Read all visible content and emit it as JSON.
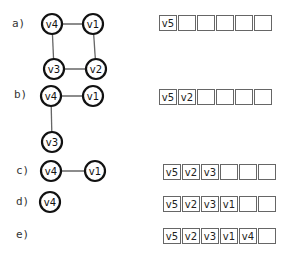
{
  "steps": [
    {
      "label": "a)",
      "queue": [
        "v5",
        "",
        "",
        "",
        "",
        ""
      ],
      "nodes": [
        {
          "id": "v4",
          "x": 52,
          "y": 24
        },
        {
          "id": "v1",
          "x": 93,
          "y": 24
        },
        {
          "id": "v3",
          "x": 54,
          "y": 69
        },
        {
          "id": "v2",
          "x": 96,
          "y": 69
        }
      ],
      "edges": [
        [
          "v4",
          "v1"
        ],
        [
          "v1",
          "v2"
        ],
        [
          "v2",
          "v3"
        ],
        [
          "v3",
          "v4"
        ]
      ]
    },
    {
      "label": "b)",
      "queue": [
        "v5",
        "v2",
        "",
        "",
        "",
        ""
      ],
      "nodes": [
        {
          "id": "v4",
          "x": 51,
          "y": 96
        },
        {
          "id": "v1",
          "x": 93,
          "y": 96
        },
        {
          "id": "v3",
          "x": 52,
          "y": 142
        }
      ],
      "edges": [
        [
          "v4",
          "v1"
        ],
        [
          "v4",
          "v3"
        ]
      ]
    },
    {
      "label": "c)",
      "queue": [
        "v5",
        "v2",
        "v3",
        "",
        "",
        ""
      ],
      "nodes": [
        {
          "id": "v4",
          "x": 51,
          "y": 171
        },
        {
          "id": "v1",
          "x": 95,
          "y": 171
        }
      ],
      "edges": [
        [
          "v4",
          "v1"
        ]
      ]
    },
    {
      "label": "d)",
      "queue": [
        "v5",
        "v2",
        "v3",
        "v1",
        "",
        ""
      ],
      "nodes": [
        {
          "id": "v4",
          "x": 50,
          "y": 202
        }
      ],
      "edges": []
    },
    {
      "label": "e)",
      "queue": [
        "v5",
        "v2",
        "v3",
        "v1",
        "v4",
        ""
      ],
      "nodes": [],
      "edges": []
    }
  ]
}
